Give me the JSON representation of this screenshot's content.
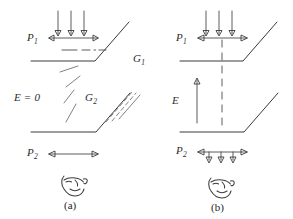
{
  "figure": {
    "panels": [
      {
        "id": "a",
        "caption": "(a)",
        "labels": {
          "pressure_top": "P",
          "pressure_top_sub": "1",
          "pressure_bottom": "P",
          "pressure_bottom_sub": "2",
          "field": "E = 0",
          "gap_top": "G",
          "gap_top_sub": "1",
          "gap_bottom": "G",
          "gap_bottom_sub": "2"
        },
        "annotations": {
          "down_arrow_count": 3,
          "span_arrow": "double-headed horizontal",
          "center_line_style": "dash-dot",
          "hatch_lines": 5
        }
      },
      {
        "id": "b",
        "caption": "(b)",
        "labels": {
          "pressure_top": "P",
          "pressure_top_sub": "1",
          "pressure_bottom": "P",
          "pressure_bottom_sub": "2",
          "field": "E"
        },
        "annotations": {
          "down_arrow_count_top": 3,
          "down_arrow_count_bottom": 3,
          "span_arrow": "double-headed horizontal",
          "center_line_style": "dashed-vertical",
          "field_arrow": "upward"
        }
      }
    ],
    "icon_glyph_name": "face-profile-icon",
    "colors": {
      "ink": "#3a3a3a",
      "ink_light": "#6a6a6a",
      "text": "#2b2b2b",
      "background": "#ffffff"
    }
  }
}
